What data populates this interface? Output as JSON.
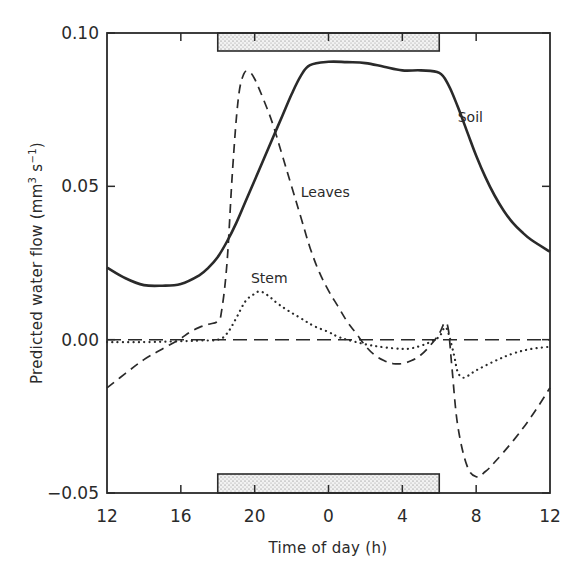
{
  "chart_data": {
    "type": "line",
    "title": "",
    "xlabel": "Time of day (h)",
    "ylabel": "Predicted water flow (mm3 s-1)",
    "ylabel_parts": {
      "main": "Predicted  water  flow  (mm",
      "sup1": "3",
      "mid": " s",
      "sup2": "−1",
      "end": ")"
    },
    "x_ticks": [
      12,
      16,
      20,
      24,
      28,
      32,
      36
    ],
    "x_tick_labels": [
      "12",
      "16",
      "20",
      "0",
      "4",
      "8",
      "12"
    ],
    "xlim": [
      12,
      36
    ],
    "y_ticks": [
      0.1,
      0.05,
      0.0,
      -0.05
    ],
    "y_tick_labels": [
      "0.10",
      "0.05",
      "0.00",
      "-0.05"
    ],
    "ylim": [
      -0.05,
      0.1
    ],
    "grid": false,
    "legend": "inline labels",
    "dark_period": {
      "start": 18,
      "end": 30,
      "description": "stippled bars at top and bottom indicating night"
    },
    "zero_line": {
      "y": 0,
      "style": "long-dash"
    },
    "series": [
      {
        "name": "Soil",
        "style": "solid",
        "label_pos": {
          "x": 31.0,
          "y": 0.071
        },
        "x": [
          12,
          13,
          14,
          15,
          16,
          17,
          17.5,
          18,
          18.5,
          19,
          19.5,
          20,
          20.5,
          21,
          21.5,
          22,
          22.5,
          23,
          24,
          25,
          26,
          27,
          28,
          29,
          30,
          30.5,
          31,
          31.5,
          32,
          32.5,
          33,
          33.5,
          34,
          34.5,
          35,
          36
        ],
        "values": [
          0.0235,
          0.02,
          0.0178,
          0.0176,
          0.0182,
          0.021,
          0.0235,
          0.027,
          0.032,
          0.038,
          0.045,
          0.052,
          0.059,
          0.066,
          0.073,
          0.08,
          0.086,
          0.0895,
          0.0906,
          0.0905,
          0.0902,
          0.089,
          0.0878,
          0.0878,
          0.087,
          0.083,
          0.076,
          0.068,
          0.06,
          0.053,
          0.047,
          0.042,
          0.038,
          0.035,
          0.0325,
          0.0287
        ]
      },
      {
        "name": "Leaves",
        "style": "dashed",
        "label_pos": {
          "x": 22.5,
          "y": 0.0465
        },
        "x": [
          12,
          13,
          14,
          15,
          15.9,
          16.5,
          17,
          17.5,
          18,
          18.2,
          18.5,
          18.8,
          19.1,
          19.4,
          19.7,
          20.0,
          20.5,
          21,
          21.5,
          22,
          22.5,
          23,
          23.5,
          24,
          24.5,
          25,
          25.5,
          26,
          26.5,
          27,
          27.5,
          28,
          28.5,
          29,
          29.5,
          30,
          30.3,
          30.5,
          30.7,
          31,
          31.5,
          32,
          32.5,
          33,
          34,
          35,
          36
        ],
        "values": [
          -0.0157,
          -0.011,
          -0.0065,
          -0.003,
          0.0,
          0.0025,
          0.004,
          0.005,
          0.006,
          0.009,
          0.025,
          0.055,
          0.078,
          0.0865,
          0.0873,
          0.085,
          0.078,
          0.07,
          0.06,
          0.05,
          0.04,
          0.03,
          0.022,
          0.016,
          0.011,
          0.006,
          0.002,
          -0.002,
          -0.005,
          -0.0068,
          -0.0078,
          -0.0078,
          -0.0068,
          -0.005,
          -0.002,
          0.002,
          0.0055,
          0.003,
          -0.01,
          -0.028,
          -0.041,
          -0.0447,
          -0.043,
          -0.04,
          -0.033,
          -0.025,
          -0.0157
        ]
      },
      {
        "name": "Stem",
        "style": "dotted",
        "label_pos": {
          "x": 19.8,
          "y": 0.0185
        },
        "x": [
          12,
          14,
          16,
          17,
          18,
          18.5,
          19,
          19.5,
          20,
          20.3,
          20.7,
          21.2,
          21.8,
          22.5,
          23.2,
          24,
          24.5,
          25,
          26,
          27,
          28,
          28.5,
          29,
          29.5,
          30,
          30.3,
          30.5,
          30.8,
          31,
          31.3,
          31.7,
          32,
          33,
          34,
          35,
          36
        ],
        "values": [
          -0.0008,
          -0.0008,
          -0.0005,
          -0.0003,
          0.0,
          0.002,
          0.007,
          0.0125,
          0.015,
          0.0157,
          0.0145,
          0.012,
          0.0095,
          0.007,
          0.0045,
          0.0025,
          0.001,
          0.0,
          -0.0015,
          -0.0025,
          -0.003,
          -0.0028,
          -0.002,
          -0.0008,
          0.001,
          0.004,
          0.002,
          -0.005,
          -0.0105,
          -0.0124,
          -0.0112,
          -0.01,
          -0.007,
          -0.0045,
          -0.003,
          -0.0023
        ]
      }
    ]
  }
}
